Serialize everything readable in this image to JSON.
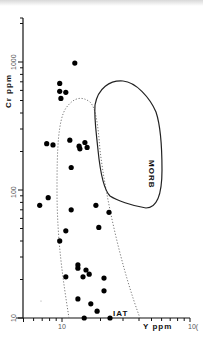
{
  "chart_data": {
    "type": "scatter",
    "title": "",
    "xlabel": "Y ppm",
    "ylabel": "Cr ppm",
    "xscale": "log",
    "yscale": "log",
    "xlim": [
      5,
      100
    ],
    "ylim": [
      10,
      2000
    ],
    "x_tick_labels": [
      "10",
      "100"
    ],
    "y_tick_labels": [
      "10",
      "100",
      "1000"
    ],
    "grid": false,
    "legend": null,
    "fields": [
      {
        "name": "MORB",
        "style": "solid outline"
      },
      {
        "name": "IAT",
        "style": "dotted outline"
      }
    ],
    "annotations": [
      "MORB",
      "IAT"
    ],
    "series": [
      {
        "name": "samples",
        "points": [
          {
            "x": 12.6,
            "y": 980
          },
          {
            "x": 9.6,
            "y": 680
          },
          {
            "x": 9.6,
            "y": 590
          },
          {
            "x": 10.7,
            "y": 580
          },
          {
            "x": 9.8,
            "y": 520
          },
          {
            "x": 7.6,
            "y": 230
          },
          {
            "x": 8.5,
            "y": 225
          },
          {
            "x": 11.5,
            "y": 245
          },
          {
            "x": 13.6,
            "y": 220
          },
          {
            "x": 13.8,
            "y": 210
          },
          {
            "x": 15.1,
            "y": 235
          },
          {
            "x": 15.7,
            "y": 215
          },
          {
            "x": 11.8,
            "y": 150
          },
          {
            "x": 6.7,
            "y": 76
          },
          {
            "x": 7.8,
            "y": 87
          },
          {
            "x": 11.8,
            "y": 70
          },
          {
            "x": 10.7,
            "y": 48
          },
          {
            "x": 18.4,
            "y": 76
          },
          {
            "x": 23.3,
            "y": 67
          },
          {
            "x": 19.4,
            "y": 51
          },
          {
            "x": 9.6,
            "y": 40
          },
          {
            "x": 13.3,
            "y": 26
          },
          {
            "x": 13.3,
            "y": 24.5
          },
          {
            "x": 15.4,
            "y": 23.7
          },
          {
            "x": 16.3,
            "y": 22
          },
          {
            "x": 14.6,
            "y": 21
          },
          {
            "x": 10.7,
            "y": 21
          },
          {
            "x": 21.3,
            "y": 20.5
          },
          {
            "x": 21.3,
            "y": 16.3
          },
          {
            "x": 13.3,
            "y": 14.1
          },
          {
            "x": 16.8,
            "y": 12.9
          },
          {
            "x": 18.8,
            "y": 11.3
          },
          {
            "x": 14.9,
            "y": 10
          },
          {
            "x": 23.7,
            "y": 10
          }
        ]
      }
    ]
  },
  "labels": {
    "x_axis": "Y ppm",
    "y_axis": "Cr ppm",
    "x_tick_10": "10",
    "x_tick_100": "10(",
    "y_tick_10": "10",
    "y_tick_100": "100",
    "y_tick_1000": "1000",
    "morb": "MORB",
    "iat": "IAT"
  }
}
